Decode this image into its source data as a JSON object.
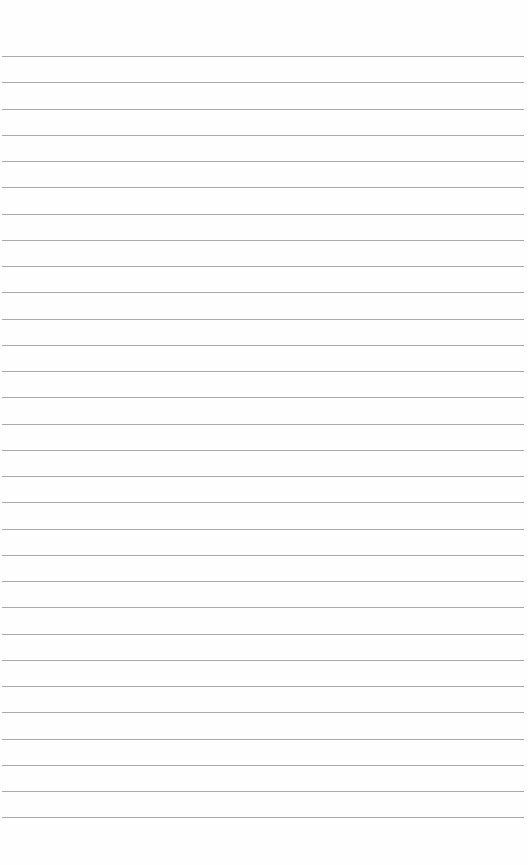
{
  "page": {
    "type": "lined-paper",
    "background_color": "#fefefe",
    "rule_color": "#a9a9a9",
    "rule_count": 30,
    "first_rule_y": 56,
    "rule_spacing": 26.25,
    "rule_left": 2,
    "rule_width": 522
  }
}
